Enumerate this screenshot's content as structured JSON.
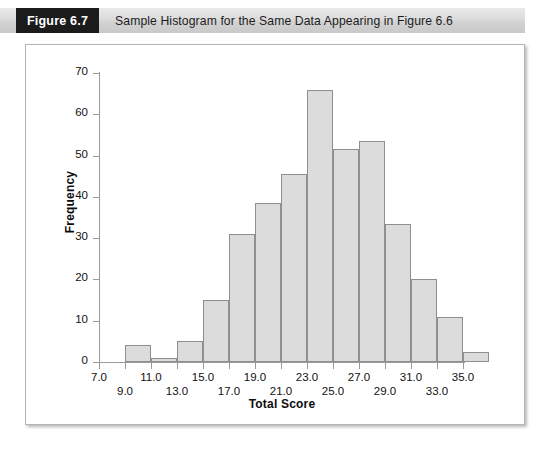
{
  "figure": {
    "number_label": "Figure 6.7",
    "caption": "Sample Histogram for the Same Data Appearing in Figure 6.6"
  },
  "chart_data": {
    "type": "bar",
    "title": "Sample Histogram for the Same Data Appearing in Figure 6.6",
    "xlabel": "Total Score",
    "ylabel": "Frequency",
    "xlim": [
      7.0,
      35.0
    ],
    "ylim": [
      0,
      70
    ],
    "grid": false,
    "legend": null,
    "bar_color": "#dcdcdc",
    "bar_edge_color": "#8f8f8f",
    "y_ticks": [
      0,
      10,
      20,
      30,
      40,
      50,
      60,
      70
    ],
    "y_tick_labels": [
      "0",
      "10",
      "20",
      "30",
      "40",
      "50",
      "60",
      "70"
    ],
    "x_ticks": [
      7.0,
      9.0,
      11.0,
      13.0,
      15.0,
      17.0,
      19.0,
      21.0,
      23.0,
      25.0,
      27.0,
      29.0,
      31.0,
      33.0,
      35.0
    ],
    "x_tick_labels": [
      "7.0",
      "9.0",
      "11.0",
      "13.0",
      "15.0",
      "17.0",
      "19.0",
      "21.0",
      "23.0",
      "25.0",
      "27.0",
      "29.0",
      "31.0",
      "33.0",
      "35.0"
    ],
    "bin_width": 2.0,
    "bins": [
      {
        "left": 7.0,
        "right": 9.0,
        "center": 8.0,
        "value": 0
      },
      {
        "left": 9.0,
        "right": 11.0,
        "center": 10.0,
        "value": 4
      },
      {
        "left": 11.0,
        "right": 13.0,
        "center": 12.0,
        "value": 1
      },
      {
        "left": 13.0,
        "right": 15.0,
        "center": 14.0,
        "value": 5
      },
      {
        "left": 15.0,
        "right": 17.0,
        "center": 16.0,
        "value": 15
      },
      {
        "left": 17.0,
        "right": 19.0,
        "center": 18.0,
        "value": 31
      },
      {
        "left": 19.0,
        "right": 21.0,
        "center": 20.0,
        "value": 38.5
      },
      {
        "left": 21.0,
        "right": 23.0,
        "center": 22.0,
        "value": 45.5
      },
      {
        "left": 23.0,
        "right": 25.0,
        "center": 24.0,
        "value": 66
      },
      {
        "left": 25.0,
        "right": 27.0,
        "center": 26.0,
        "value": 51.5
      },
      {
        "left": 27.0,
        "right": 29.0,
        "center": 28.0,
        "value": 53.5
      },
      {
        "left": 29.0,
        "right": 31.0,
        "center": 30.0,
        "value": 33.5
      },
      {
        "left": 31.0,
        "right": 33.0,
        "center": 32.0,
        "value": 20
      },
      {
        "left": 33.0,
        "right": 35.0,
        "center": 34.0,
        "value": 11
      },
      {
        "left": 35.0,
        "right": 37.0,
        "center": 36.0,
        "value": 2.5
      }
    ],
    "categories": [
      "8.0",
      "10.0",
      "12.0",
      "14.0",
      "16.0",
      "18.0",
      "20.0",
      "22.0",
      "24.0",
      "26.0",
      "28.0",
      "30.0",
      "32.0",
      "34.0",
      "36.0"
    ],
    "values": [
      0,
      4,
      1,
      5,
      15,
      31,
      38.5,
      45.5,
      66,
      51.5,
      53.5,
      33.5,
      20,
      11,
      2.5
    ]
  }
}
